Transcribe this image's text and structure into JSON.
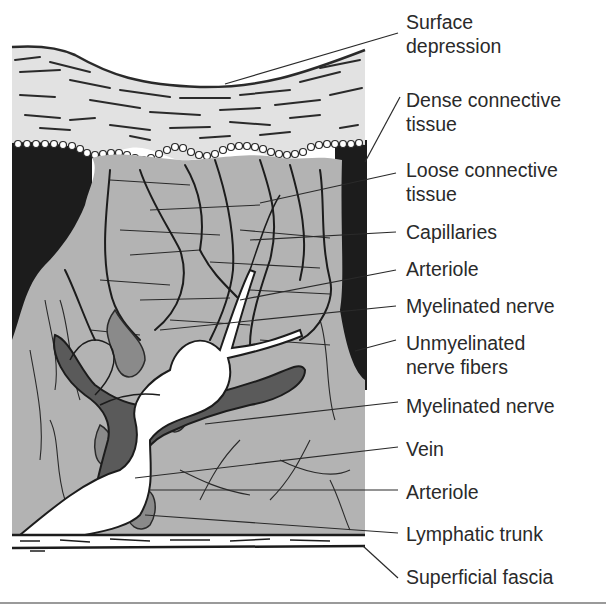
{
  "figure": {
    "type": "anatomical-illustration",
    "colors": {
      "background": "#ffffff",
      "dense_tissue_fill": "#e2e2e2",
      "loose_tissue_fill": "#b3b3b3",
      "dark_region": "#1c1c1c",
      "vein_fill": "#5a5a5a",
      "artery_fill": "#ffffff",
      "lymph_fill": "#7d7d7d",
      "line_color": "#2a2a2a",
      "label_text": "#2a2a2a",
      "bottom_rule": "#9a9a9a"
    }
  },
  "labels": [
    {
      "id": "surface-depression",
      "lines": [
        "Surface",
        "depression"
      ],
      "top": 10
    },
    {
      "id": "dense-connective-tissue",
      "lines": [
        "Dense connective",
        "tissue"
      ],
      "top": 88
    },
    {
      "id": "loose-connective-tissue",
      "lines": [
        "Loose connective",
        "tissue"
      ],
      "top": 158
    },
    {
      "id": "capillaries",
      "lines": [
        "Capillaries"
      ],
      "top": 220
    },
    {
      "id": "arteriole-upper",
      "lines": [
        "Arteriole"
      ],
      "top": 256
    },
    {
      "id": "myelinated-nerve-upper",
      "lines": [
        "Myelinated nerve"
      ],
      "top": 294
    },
    {
      "id": "unmyelinated-nerve-fibers",
      "lines": [
        "Unmyelinated",
        "nerve fibers"
      ],
      "top": 330
    },
    {
      "id": "myelinated-nerve-lower",
      "lines": [
        "Myelinated nerve"
      ],
      "top": 394
    },
    {
      "id": "vein",
      "lines": [
        "Vein"
      ],
      "top": 437
    },
    {
      "id": "arteriole-lower",
      "lines": [
        "Arteriole"
      ],
      "top": 480
    },
    {
      "id": "lymphatic-trunk",
      "lines": [
        "Lymphatic trunk"
      ],
      "top": 522
    },
    {
      "id": "superficial-fascia",
      "lines": [
        "Superficial fascia"
      ],
      "top": 565
    }
  ]
}
